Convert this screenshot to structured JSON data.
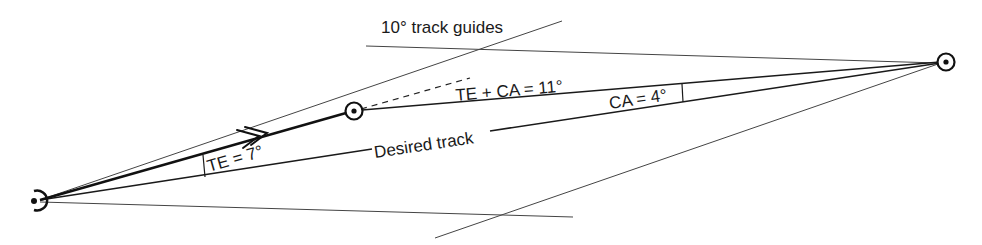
{
  "diagram": {
    "title_label": "10° track guides",
    "labels": {
      "track_error": "TE = 7°",
      "desired_track": "Desired track",
      "total_correction": "TE + CA = 11°",
      "closing_angle": "CA = 4°"
    },
    "values": {
      "track_error_deg": 7,
      "closing_angle_deg": 4,
      "total_correction_deg": 11,
      "guide_angle_deg": 10
    },
    "points": {
      "origin": "departure-fix",
      "intermediate": "position-fix",
      "destination": "destination-fix"
    },
    "colors": {
      "stroke": "#1a1a1a",
      "guide": "#444444",
      "background": "#ffffff"
    }
  }
}
